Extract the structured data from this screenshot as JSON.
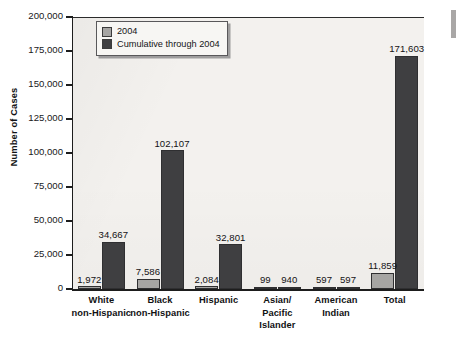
{
  "chart_data": {
    "type": "bar",
    "title": "",
    "subtitle": "",
    "xlabel": "",
    "ylabel": "Number of Cases",
    "ylim": [
      0,
      200000
    ],
    "ytick_labels": [
      "0",
      "25,000",
      "50,000",
      "75,000",
      "100,000",
      "125,000",
      "150,000",
      "175,000",
      "200,000"
    ],
    "ytick_values": [
      0,
      25000,
      50000,
      75000,
      100000,
      125000,
      150000,
      175000,
      200000
    ],
    "grid": false,
    "legend_position": "upper-left-inside",
    "categories": [
      "White non-Hispanic",
      "Black non-Hispanic",
      "Hispanic",
      "Asian/ Pacific Islander",
      "American Indian",
      "Total"
    ],
    "category_lines": [
      [
        "White",
        "non-Hispanic"
      ],
      [
        "Black",
        "non-Hispanic"
      ],
      [
        "Hispanic"
      ],
      [
        "Asian/",
        "Pacific",
        "Islander"
      ],
      [
        "American",
        "Indian"
      ],
      [
        "Total"
      ]
    ],
    "series": [
      {
        "name": "2004",
        "color": "#a6a5a3",
        "values": [
          1972,
          7586,
          2084,
          99,
          597,
          11859
        ],
        "labels": [
          "1,972",
          "7,586",
          "2,084",
          "99",
          "597",
          "11,859"
        ]
      },
      {
        "name": "Cumulative through 2004",
        "color": "#3f3f41",
        "values": [
          34667,
          102107,
          32801,
          940,
          597,
          171603
        ],
        "labels": [
          "34,667",
          "102,107",
          "32,801",
          "940",
          "597",
          "171,603"
        ]
      }
    ]
  },
  "legend": {
    "items": [
      {
        "label": "2004",
        "color": "#a6a5a3"
      },
      {
        "label": "Cumulative through 2004",
        "color": "#3f3f41"
      }
    ]
  },
  "axis": {
    "y_title": "Number of Cases"
  }
}
